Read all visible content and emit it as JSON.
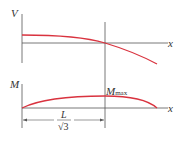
{
  "diagram": {
    "top_panel": {
      "y_label": "V",
      "x_label": "x",
      "curve": "shear force decreasing from positive to negative, crossing zero at x = L/√3"
    },
    "bottom_panel": {
      "y_label": "M",
      "x_label": "x",
      "max_label_main": "M",
      "max_label_sub": "max",
      "curve": "bending moment parabola-like, peak at x = L/√3"
    },
    "dimension": {
      "numerator": "L",
      "denominator": "√3"
    },
    "colors": {
      "curve": "#d9333f",
      "axis": "#555555"
    }
  }
}
